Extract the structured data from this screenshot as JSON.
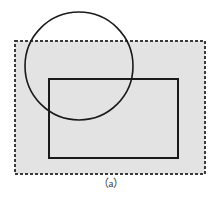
{
  "figure": {
    "caption": "（a）",
    "colors": {
      "background": "#ffffff",
      "region_fill": "#e3e3e3",
      "region_stroke": "#3a3a3a",
      "rect_stroke": "#1a1a1a",
      "circle_stroke": "#1a1a1a",
      "caption_text": "#3b3b3b"
    },
    "shapes": {
      "dashed_region": {
        "name": "dashed-region",
        "shape": "rectangle",
        "style": "dashed",
        "x": 15,
        "y": 41,
        "width": 190,
        "height": 133,
        "stroke_width": 1.4,
        "dash_pattern": "3,2",
        "filled": true
      },
      "solid_rectangle": {
        "name": "solid-rectangle",
        "shape": "rectangle",
        "style": "solid",
        "x": 49,
        "y": 79,
        "width": 129,
        "height": 79,
        "stroke_width": 1.6,
        "filled": false
      },
      "circle": {
        "name": "circle",
        "shape": "circle",
        "style": "solid",
        "cx": 79,
        "cy": 66,
        "r": 54,
        "stroke_width": 1.6,
        "filled": false
      }
    }
  }
}
